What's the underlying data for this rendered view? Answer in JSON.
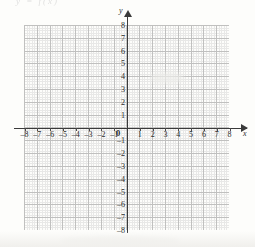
{
  "header": {
    "fragment_text": "y = f(x)"
  },
  "axes": {
    "x_label": "x",
    "y_label": "y",
    "origin_label": "0",
    "x_tick_labels": [
      "–8",
      "–7",
      "–6",
      "–5",
      "–4",
      "–3",
      "–2",
      "–1",
      "1",
      "2",
      "3",
      "4",
      "5",
      "6",
      "7",
      "8"
    ],
    "y_tick_labels": [
      "8",
      "7",
      "6",
      "5",
      "4",
      "3",
      "2",
      "1",
      "–1",
      "–2",
      "–3",
      "–4",
      "–5",
      "–6",
      "–7",
      "–8"
    ]
  },
  "chart_data": {
    "type": "scatter",
    "title": "",
    "subtitle": "",
    "xlabel": "x",
    "ylabel": "y",
    "xlim": [
      -8,
      8
    ],
    "ylim": [
      -8,
      8
    ],
    "xticks": [
      -8,
      -7,
      -6,
      -5,
      -4,
      -3,
      -2,
      -1,
      0,
      1,
      2,
      3,
      4,
      5,
      6,
      7,
      8
    ],
    "yticks": [
      -8,
      -7,
      -6,
      -5,
      -4,
      -3,
      -2,
      -1,
      0,
      1,
      2,
      3,
      4,
      5,
      6,
      7,
      8
    ],
    "grid": true,
    "minor_grid": true,
    "minor_subdivisions": 5,
    "legend": null,
    "legend_position": "none",
    "series": [],
    "x": [],
    "values": [],
    "annotations": []
  },
  "colors": {
    "axis": "#3a3a3a",
    "major_grid": "#a8a8a8",
    "minor_grid": "#c2c2c2",
    "paper": "#fdfdfb",
    "text": "#2b2b2b"
  }
}
